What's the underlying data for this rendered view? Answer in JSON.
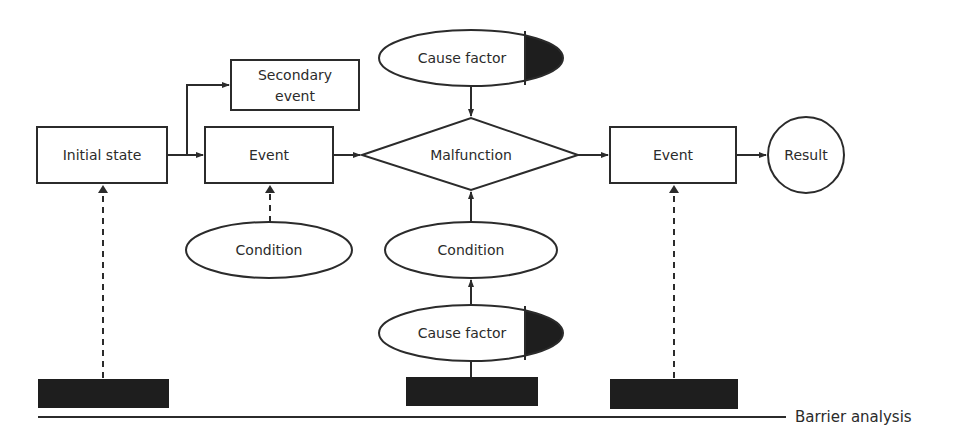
{
  "diagram": {
    "nodes": {
      "initial_state": "Initial state",
      "secondary_event_line1": "Secondary",
      "secondary_event_line2": "event",
      "event_1": "Event",
      "cause_factor_top": "Cause factor",
      "malfunction": "Malfunction",
      "event_2": "Event",
      "result": "Result",
      "condition_1": "Condition",
      "condition_2": "Condition",
      "cause_factor_bottom": "Cause factor"
    },
    "baseline_label": "Barrier analysis",
    "colors": {
      "stroke": "#2b2b2b",
      "barrier_fill": "#1e1e1e",
      "background": "#ffffff"
    },
    "edges": [
      {
        "from": "Initial state",
        "to": "Event",
        "style": "solid"
      },
      {
        "from": "Initial state",
        "to": "Secondary event",
        "style": "solid"
      },
      {
        "from": "Event",
        "to": "Malfunction",
        "style": "solid"
      },
      {
        "from": "Cause factor (top)",
        "to": "Malfunction",
        "style": "solid"
      },
      {
        "from": "Condition (center)",
        "to": "Malfunction",
        "style": "solid"
      },
      {
        "from": "Cause factor (bottom)",
        "to": "Condition (center)",
        "style": "solid"
      },
      {
        "from": "Malfunction",
        "to": "Event (right)",
        "style": "solid"
      },
      {
        "from": "Event (right)",
        "to": "Result",
        "style": "solid"
      },
      {
        "from": "Barrier 1",
        "to": "Initial state",
        "style": "dashed"
      },
      {
        "from": "Condition (left)",
        "to": "Event",
        "style": "dashed"
      },
      {
        "from": "Barrier 3",
        "to": "Event (right)",
        "style": "dashed"
      }
    ],
    "barriers": [
      "barrier-1",
      "barrier-2",
      "barrier-3"
    ]
  }
}
